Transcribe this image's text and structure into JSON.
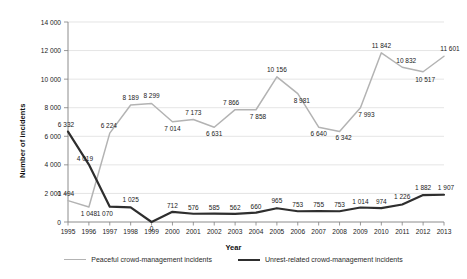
{
  "chart_data": {
    "type": "line",
    "title": "",
    "xlabel": "Year",
    "ylabel": "Number of incidents",
    "ylim": [
      0,
      14000
    ],
    "ytick_step": 2000,
    "ytick_labels": [
      "0",
      "2 000",
      "4 000",
      "6 000",
      "8 000",
      "10 000",
      "12 000",
      "14 000"
    ],
    "grid": "horizontal",
    "legend_position": "bottom",
    "categories": [
      "1995",
      "1996",
      "1997",
      "1998",
      "1999",
      "2000",
      "2001",
      "2002",
      "2003",
      "2004",
      "2005",
      "2006",
      "2007",
      "2008",
      "2009",
      "2010",
      "2011",
      "2012",
      "2013"
    ],
    "series": [
      {
        "name": "Peaceful crowd-management incidents",
        "color": "#b3b3b3",
        "values": [
          1494,
          1048,
          6224,
          8189,
          8299,
          7014,
          7173,
          6631,
          7866,
          7858,
          10156,
          8981,
          6640,
          6342,
          7993,
          11842,
          10832,
          10517,
          11601
        ],
        "labels": [
          "1 494",
          "1 048",
          "6 224",
          "8 189",
          "8 299",
          "7 014",
          "7 173",
          "6 631",
          "7 866",
          "7 858",
          "10 156",
          "8 981",
          "6 640",
          "6 342",
          "7 993",
          "11 842",
          "10 832",
          "10 517",
          "11 601"
        ]
      },
      {
        "name": "Unrest-related crowd-management incidents",
        "color": "#2e2e2e",
        "values": [
          6332,
          4019,
          1070,
          1025,
          0,
          712,
          576,
          585,
          562,
          660,
          965,
          753,
          755,
          753,
          1014,
          974,
          1226,
          1882,
          1907
        ],
        "labels": [
          "6 332",
          "4 019",
          "1 070",
          "1 025",
          "0",
          "712",
          "576",
          "585",
          "562",
          "660",
          "965",
          "753",
          "755",
          "753",
          "1 014",
          "974",
          "1 226",
          "1 882",
          "1 907"
        ]
      }
    ]
  },
  "legend": {
    "items": [
      {
        "label": "Peaceful crowd-management incidents"
      },
      {
        "label": "Unrest-related crowd-management incidents"
      }
    ]
  },
  "axes": {
    "x_title": "Year",
    "y_title": "Number of incidents"
  }
}
